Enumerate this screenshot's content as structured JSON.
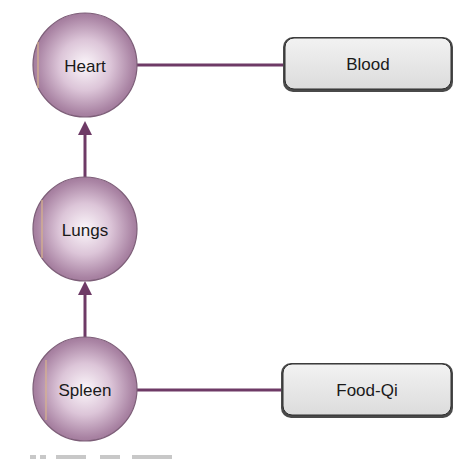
{
  "diagram": {
    "organs": [
      {
        "id": "heart",
        "label": "Heart"
      },
      {
        "id": "lungs",
        "label": "Lungs"
      },
      {
        "id": "spleen",
        "label": "Spleen"
      }
    ],
    "substances": [
      {
        "id": "blood",
        "label": "Blood",
        "linked_to": "heart"
      },
      {
        "id": "food-qi",
        "label": "Food-Qi",
        "linked_to": "spleen"
      }
    ],
    "arrows": [
      {
        "from": "spleen",
        "to": "lungs"
      },
      {
        "from": "lungs",
        "to": "heart"
      }
    ],
    "colors": {
      "connector": "#6e3a66",
      "circle_edge": "#8a6a86",
      "circle_fill_center": "#f6eef5",
      "circle_fill_edge": "#a97fa3",
      "box_fill": "#e6e6e6",
      "box_border": "#3a3a3a"
    }
  }
}
